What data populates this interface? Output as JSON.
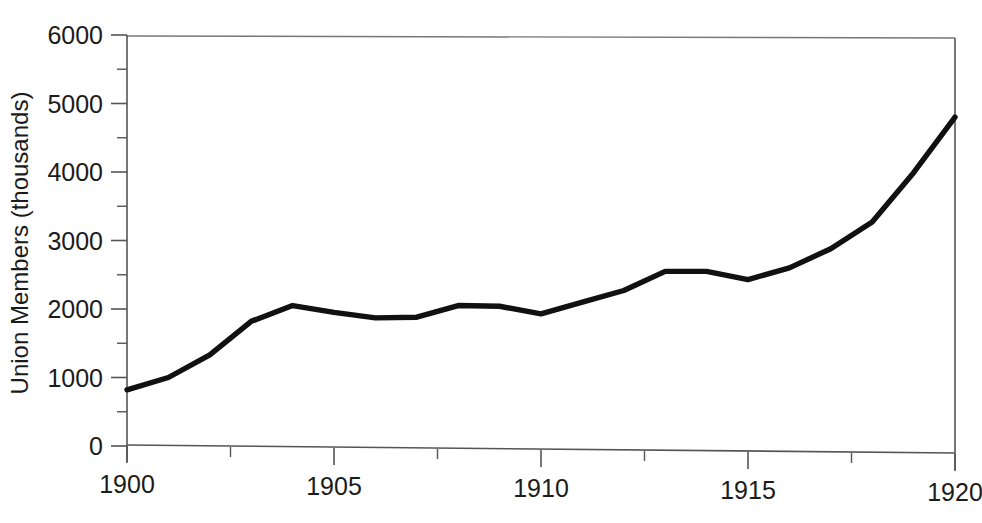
{
  "chart_data": {
    "type": "line",
    "title": "",
    "subtitle": "",
    "xlabel": "",
    "ylabel": "Union Members (thousands)",
    "x": [
      1900,
      1901,
      1902,
      1903,
      1904,
      1905,
      1906,
      1907,
      1908,
      1909,
      1910,
      1911,
      1912,
      1913,
      1914,
      1915,
      1916,
      1917,
      1918,
      1919,
      1920
    ],
    "values": [
      820,
      1000,
      1330,
      1820,
      2050,
      1950,
      1870,
      1880,
      2050,
      2040,
      1930,
      2100,
      2270,
      2550,
      2550,
      2430,
      2600,
      2880,
      3270,
      3990,
      4800
    ],
    "series": [
      {
        "name": "Union Members",
        "values": [
          820,
          1000,
          1330,
          1820,
          2050,
          1950,
          1870,
          1880,
          2050,
          2040,
          1930,
          2100,
          2270,
          2550,
          2550,
          2430,
          2600,
          2880,
          3270,
          3990,
          4800
        ],
        "color": "#111111"
      }
    ],
    "xlim": [
      1900,
      1920
    ],
    "ylim": [
      0,
      6000
    ],
    "x_major_ticks": [
      1900,
      1905,
      1910,
      1915,
      1920
    ],
    "x_major_tick_labels": [
      "1900",
      "1905",
      "1910",
      "1915",
      "1920"
    ],
    "x_minor_tick_interval": 2.5,
    "y_major_ticks": [
      0,
      1000,
      2000,
      3000,
      4000,
      5000,
      6000
    ],
    "y_major_tick_labels": [
      "0",
      "1000",
      "2000",
      "3000",
      "4000",
      "5000",
      "6000"
    ],
    "y_minor_tick_interval": 500,
    "grid": false,
    "legend": false,
    "legend_position": "none"
  },
  "axes": {
    "y_title": "Union Members (thousands)",
    "x_title": ""
  }
}
